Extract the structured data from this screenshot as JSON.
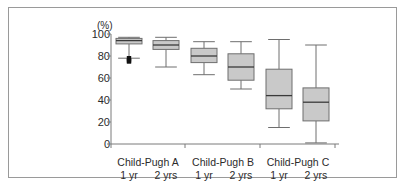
{
  "chart_data": {
    "type": "box",
    "title": "",
    "xlabel": "",
    "ylabel": "(%)",
    "unit_label": "(%)",
    "ylim": [
      0,
      100
    ],
    "yticks": [
      0,
      20,
      40,
      60,
      80,
      100
    ],
    "ytick_labels": [
      "0",
      "20",
      "40",
      "60",
      "80",
      "100"
    ],
    "grid": false,
    "legend": "none",
    "groups": [
      {
        "name": "Child-Pugh A"
      },
      {
        "name": "Child-Pugh B"
      },
      {
        "name": "Child-Pugh C"
      }
    ],
    "categories": [
      "1 yr",
      "2 yrs",
      "1 yr",
      "2 yrs",
      "1 yr",
      "2 yrs"
    ],
    "boxes": [
      {
        "label": "1 yr",
        "group": "Child-Pugh A",
        "whisker_high": 97,
        "q3": 96,
        "median": 94,
        "q1": 91,
        "whisker_low": 78,
        "outliers": [
          78,
          76,
          75
        ]
      },
      {
        "label": "2 yrs",
        "group": "Child-Pugh A",
        "whisker_high": 97,
        "q3": 94,
        "median": 90,
        "q1": 86,
        "whisker_low": 70,
        "outliers": []
      },
      {
        "label": "1 yr",
        "group": "Child-Pugh B",
        "whisker_high": 93,
        "q3": 87,
        "median": 80,
        "q1": 74,
        "whisker_low": 63,
        "outliers": []
      },
      {
        "label": "2 yrs",
        "group": "Child-Pugh B",
        "whisker_high": 93,
        "q3": 82,
        "median": 70,
        "q1": 58,
        "whisker_low": 50,
        "outliers": []
      },
      {
        "label": "1 yr",
        "group": "Child-Pugh C",
        "whisker_high": 95,
        "q3": 68,
        "median": 44,
        "q1": 32,
        "whisker_low": 15,
        "outliers": []
      },
      {
        "label": "2 yrs",
        "group": "Child-Pugh C",
        "whisker_high": 90,
        "q3": 51,
        "median": 38,
        "q1": 21,
        "whisker_low": 1,
        "outliers": []
      }
    ],
    "colors": {
      "box_fill": "#c9c9c9",
      "box_stroke": "#6e6e6e",
      "median_stroke": "#3a3a3a",
      "whisker_stroke": "#6e6e6e",
      "axis_stroke": "#7a7a7a",
      "outlier_fill": "#111111",
      "frame_stroke": "#9a9a9a",
      "text": "#2b2b2b"
    }
  }
}
